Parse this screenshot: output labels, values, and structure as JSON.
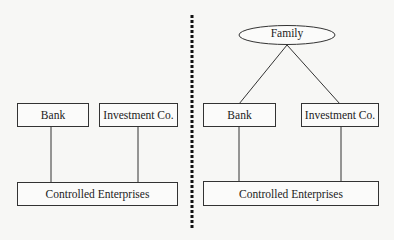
{
  "diagram": {
    "left_panel": {
      "nodes": [
        {
          "id": "bank",
          "label": "Bank"
        },
        {
          "id": "investment",
          "label": "Investment Co."
        },
        {
          "id": "controlled",
          "label": "Controlled Enterprises"
        }
      ],
      "edges": [
        {
          "from": "bank",
          "to": "controlled"
        },
        {
          "from": "investment",
          "to": "controlled"
        }
      ]
    },
    "right_panel": {
      "nodes": [
        {
          "id": "family",
          "label": "Family",
          "shape": "ellipse"
        },
        {
          "id": "bank",
          "label": "Bank"
        },
        {
          "id": "investment",
          "label": "Investment Co."
        },
        {
          "id": "controlled",
          "label": "Controlled Enterprises"
        }
      ],
      "edges": [
        {
          "from": "family",
          "to": "bank"
        },
        {
          "from": "family",
          "to": "investment"
        },
        {
          "from": "bank",
          "to": "controlled"
        },
        {
          "from": "investment",
          "to": "controlled"
        }
      ]
    },
    "divider": {
      "style": "dotted"
    }
  }
}
